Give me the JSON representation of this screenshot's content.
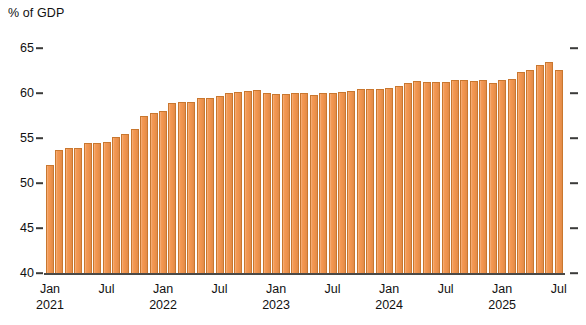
{
  "chart_data": {
    "type": "bar",
    "title": "",
    "subtitle": "",
    "ylabel": "% of GDP",
    "xlabel": "",
    "ylim": [
      40,
      65
    ],
    "yticks": [
      40,
      45,
      50,
      55,
      60,
      65
    ],
    "ytick_labels": [
      "40",
      "45",
      "50",
      "55",
      "60",
      "65"
    ],
    "grid": false,
    "legend": null,
    "bar_color": "#f2954e",
    "bar_edge_color": "#c9772f",
    "axis_color": "#4a4a48",
    "x_major_ticks": [
      "Jan 2021",
      "Jul 2021",
      "Jan 2022",
      "Jul 2022",
      "Jan 2023",
      "Jul 2023",
      "Jan 2024",
      "Jul 2024",
      "Jan 2025",
      "Jul 2025"
    ],
    "x_axis_labels": [
      {
        "month": "Jan",
        "year": "2021"
      },
      {
        "month": "Jul",
        "year": ""
      },
      {
        "month": "Jan",
        "year": "2022"
      },
      {
        "month": "Jul",
        "year": ""
      },
      {
        "month": "Jan",
        "year": "2023"
      },
      {
        "month": "Jul",
        "year": ""
      },
      {
        "month": "Jan",
        "year": "2024"
      },
      {
        "month": "Jul",
        "year": ""
      },
      {
        "month": "Jan",
        "year": "2025"
      },
      {
        "month": "Jul",
        "year": ""
      }
    ],
    "categories": [
      "Jan 2021",
      "Feb 2021",
      "Mar 2021",
      "Apr 2021",
      "May 2021",
      "Jun 2021",
      "Jul 2021",
      "Aug 2021",
      "Sep 2021",
      "Oct 2021",
      "Nov 2021",
      "Dec 2021",
      "Jan 2022",
      "Feb 2022",
      "Mar 2022",
      "Apr 2022",
      "May 2022",
      "Jun 2022",
      "Jul 2022",
      "Aug 2022",
      "Sep 2022",
      "Oct 2022",
      "Nov 2022",
      "Dec 2022",
      "Jan 2023",
      "Feb 2023",
      "Mar 2023",
      "Apr 2023",
      "May 2023",
      "Jun 2023",
      "Jul 2023",
      "Aug 2023",
      "Sep 2023",
      "Oct 2023",
      "Nov 2023",
      "Dec 2023",
      "Jan 2024",
      "Feb 2024",
      "Mar 2024",
      "Apr 2024",
      "May 2024",
      "Jun 2024",
      "Jul 2024",
      "Aug 2024",
      "Sep 2024",
      "Oct 2024",
      "Nov 2024",
      "Dec 2024",
      "Jan 2025",
      "Feb 2025",
      "Mar 2025",
      "Apr 2025",
      "May 2025",
      "Jun 2025",
      "Jul 2025"
    ],
    "values": [
      52.0,
      53.7,
      53.9,
      53.9,
      54.4,
      54.4,
      54.6,
      55.1,
      55.4,
      56.0,
      57.4,
      57.8,
      58.0,
      58.9,
      59.0,
      59.0,
      59.4,
      59.4,
      59.7,
      60.0,
      60.1,
      60.2,
      60.3,
      60.0,
      59.9,
      59.9,
      60.0,
      60.0,
      59.8,
      60.0,
      60.0,
      60.1,
      60.2,
      60.4,
      60.5,
      60.5,
      60.6,
      60.8,
      61.1,
      61.3,
      61.2,
      61.2,
      61.2,
      61.4,
      61.4,
      61.3,
      61.4,
      61.1,
      61.5,
      61.6,
      62.3,
      62.6,
      63.1,
      63.4,
      62.6
    ]
  }
}
